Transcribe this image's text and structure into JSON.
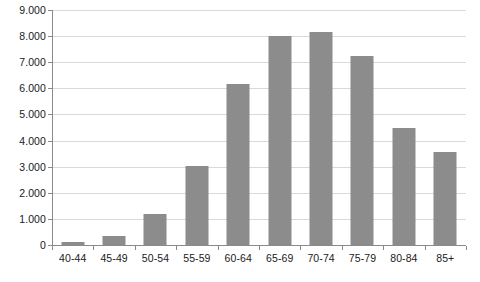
{
  "chart_data": {
    "type": "bar",
    "title": "",
    "subtitle": "",
    "xlabel": "",
    "ylabel": "",
    "categories": [
      "40-44",
      "45-49",
      "50-54",
      "55-59",
      "60-64",
      "65-69",
      "70-74",
      "75-79",
      "80-84",
      "85+"
    ],
    "values": [
      100,
      350,
      1200,
      3020,
      6150,
      8000,
      8150,
      7230,
      4500,
      3580
    ],
    "series": [
      {
        "name": "",
        "values": [
          100,
          350,
          1200,
          3020,
          6150,
          8000,
          8150,
          7230,
          4500,
          3580
        ]
      }
    ],
    "ylim": [
      0,
      9000
    ],
    "ytick_values": [
      0,
      1000,
      2000,
      3000,
      4000,
      5000,
      6000,
      7000,
      8000,
      9000
    ],
    "ytick_labels": [
      "0",
      "1.000",
      "2.000",
      "3.000",
      "4.000",
      "5.000",
      "6.000",
      "7.000",
      "8.000",
      "9.000"
    ],
    "grid": true,
    "grid_axis": "y",
    "legend": false,
    "legend_position": "none",
    "bar_color": "#8c8c8c",
    "gridline_color": "#d9d9d9",
    "axis_color": "#8a8a8a",
    "background_color": "#ffffff",
    "annotations": []
  }
}
